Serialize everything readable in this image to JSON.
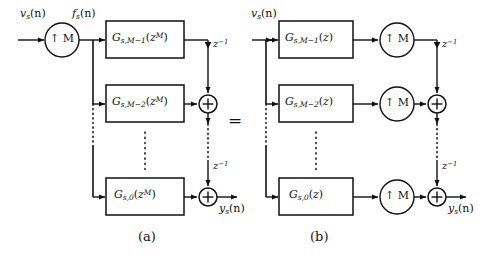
{
  "figure": {
    "panels": [
      {
        "id": "a",
        "caption": "(a)",
        "input_label": "vₛ(n)",
        "inner_label": "fₛ(n)",
        "output_label": "yₛ(n)",
        "upsampler_label": "↑ M",
        "upsampler_count": 1,
        "adder_symbol": "+",
        "adder_count": 2,
        "delay_label": "z⁻¹",
        "delay_count": 2,
        "filters": [
          {
            "base": "G",
            "sub": "s,M−1",
            "arg": "(z^M)",
            "text": "Gₛ,ₘ₋₁(zᴹ)"
          },
          {
            "base": "G",
            "sub": "s,M−2",
            "arg": "(z^M)",
            "text": "Gₛ,ₘ₋₂(zᴹ)"
          },
          {
            "base": "G",
            "sub": "s,0",
            "arg": "(z^M)",
            "text": "Gₛ,₀(zᴹ)"
          }
        ]
      },
      {
        "id": "b",
        "caption": "(b)",
        "input_label": "vₛ(n)",
        "inner_label": "",
        "output_label": "yₛ(n)",
        "upsampler_label": "↑ M",
        "upsampler_count": 3,
        "adder_symbol": "+",
        "adder_count": 2,
        "delay_label": "z⁻¹",
        "delay_count": 2,
        "filters": [
          {
            "base": "G",
            "sub": "s,M−1",
            "arg": "(z)",
            "text": "Gₛ,ₘ₋₁(z)"
          },
          {
            "base": "G",
            "sub": "s,M−2",
            "arg": "(z)",
            "text": "Gₛ,ₘ₋₂(z)"
          },
          {
            "base": "G",
            "sub": "s,0",
            "arg": "(z)",
            "text": "Gₛ,₀(z)"
          }
        ]
      }
    ],
    "equivalence_symbol": "=",
    "ellipsis_note": "vertical dotted ellipses indicate omitted intermediate polyphase branches",
    "colors": {
      "background": "#ffffff",
      "line": "#111111",
      "text": "#111111"
    }
  },
  "panel_a": {
    "filter_top": "G",
    "filter_top_sub": "s,M−1",
    "filter_top_arg_open": "(",
    "filter_top_arg_z": "z",
    "filter_top_arg_sup": "M",
    "filter_top_arg_close": ")",
    "filter_mid": "G",
    "filter_mid_sub": "s,M−2",
    "filter_bot": "G",
    "filter_bot_sub": "s,0",
    "input_v": "v",
    "input_v_sub": "s",
    "input_v_arg": "(n)",
    "inner_f": "f",
    "inner_f_sub": "s",
    "inner_f_arg": "(n)",
    "output_y": "y",
    "output_y_sub": "s",
    "output_y_arg": "(n)",
    "upsampler": "↑ M",
    "adder": "+",
    "delay_z": "z",
    "delay_exp": "−1",
    "caption": "(a)"
  },
  "panel_b": {
    "filter_top": "G",
    "filter_top_sub": "s,M−1",
    "filter_mid": "G",
    "filter_mid_sub": "s,M−2",
    "filter_bot": "G",
    "filter_bot_sub": "s,0",
    "filter_arg_open": "(",
    "filter_arg_z": "z",
    "filter_arg_close": ")",
    "input_v": "v",
    "input_v_sub": "s",
    "input_v_arg": "(n)",
    "output_y": "y",
    "output_y_sub": "s",
    "output_y_arg": "(n)",
    "upsampler": "↑ M",
    "adder": "+",
    "delay_z": "z",
    "delay_exp": "−1",
    "caption": "(b)"
  },
  "equivalence": "="
}
